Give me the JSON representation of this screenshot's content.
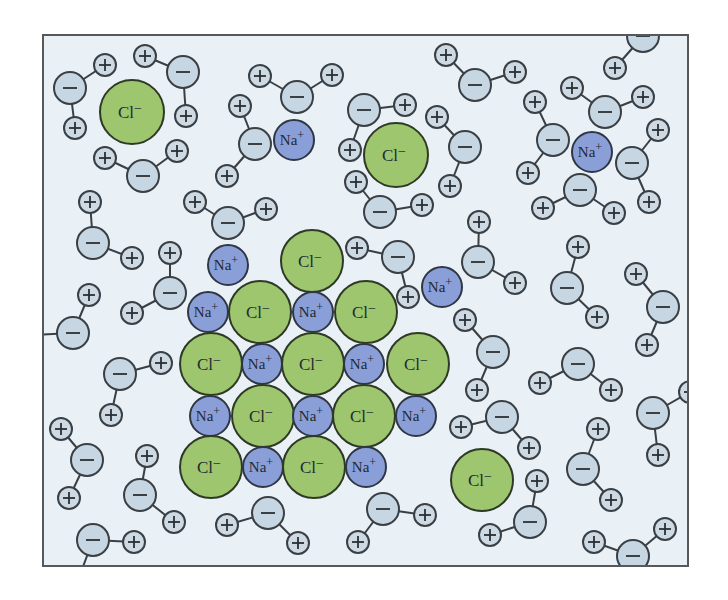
{
  "figure": {
    "title": "",
    "frame": {
      "x": 43,
      "y": 35,
      "width": 645,
      "height": 531
    },
    "colors": {
      "background": "#eaf1f6",
      "border": "#55595c",
      "chloride": "#9dc66e",
      "sodium": "#8a9fd8",
      "water_oxygen": "#c6d6e2",
      "water_hydrogen": "#cdd9e3",
      "outline": "#3a3f44"
    },
    "labels": {
      "sodium_symbol": "Na",
      "sodium_charge": "+",
      "chloride_symbol": "Cl",
      "chloride_charge": "−",
      "oxygen_sign": "−",
      "hydrogen_sign": "+"
    },
    "legend": {
      "sodium": "Na⁺ ion",
      "chloride": "Cl⁻ ion",
      "water": "H₂O molecule (− oxygen, + hydrogens)"
    }
  },
  "ions": [
    {
      "type": "Cl",
      "x": 132,
      "y": 112,
      "r": 32
    },
    {
      "type": "Na",
      "x": 294,
      "y": 140,
      "r": 20
    },
    {
      "type": "Cl",
      "x": 396,
      "y": 155,
      "r": 32
    },
    {
      "type": "Na",
      "x": 592,
      "y": 152,
      "r": 20
    },
    {
      "type": "Na",
      "x": 228,
      "y": 265,
      "r": 20
    },
    {
      "type": "Cl",
      "x": 312,
      "y": 261,
      "r": 31
    },
    {
      "type": "Na",
      "x": 442,
      "y": 287,
      "r": 20
    },
    {
      "type": "Cl",
      "x": 482,
      "y": 480,
      "r": 31
    },
    {
      "type": "Na",
      "x": 208,
      "y": 312,
      "r": 20
    },
    {
      "type": "Cl",
      "x": 260,
      "y": 312,
      "r": 31
    },
    {
      "type": "Na",
      "x": 313,
      "y": 312,
      "r": 20
    },
    {
      "type": "Cl",
      "x": 366,
      "y": 312,
      "r": 31
    },
    {
      "type": "Cl",
      "x": 211,
      "y": 364,
      "r": 31
    },
    {
      "type": "Na",
      "x": 262,
      "y": 364,
      "r": 20
    },
    {
      "type": "Cl",
      "x": 313,
      "y": 364,
      "r": 31
    },
    {
      "type": "Na",
      "x": 364,
      "y": 364,
      "r": 20
    },
    {
      "type": "Cl",
      "x": 418,
      "y": 364,
      "r": 31
    },
    {
      "type": "Na",
      "x": 210,
      "y": 416,
      "r": 20
    },
    {
      "type": "Cl",
      "x": 263,
      "y": 416,
      "r": 31
    },
    {
      "type": "Na",
      "x": 313,
      "y": 416,
      "r": 20
    },
    {
      "type": "Cl",
      "x": 364,
      "y": 416,
      "r": 31
    },
    {
      "type": "Na",
      "x": 416,
      "y": 416,
      "r": 20
    },
    {
      "type": "Cl",
      "x": 211,
      "y": 467,
      "r": 31
    },
    {
      "type": "Na",
      "x": 263,
      "y": 467,
      "r": 20
    },
    {
      "type": "Cl",
      "x": 314,
      "y": 467,
      "r": 31
    },
    {
      "type": "Na",
      "x": 366,
      "y": 467,
      "r": 20
    }
  ],
  "waters": [
    {
      "o": [
        70,
        88
      ],
      "h": [
        [
          105,
          65
        ],
        [
          75,
          128
        ]
      ]
    },
    {
      "o": [
        183,
        72
      ],
      "h": [
        [
          145,
          56
        ],
        [
          186,
          116
        ]
      ]
    },
    {
      "o": [
        143,
        176
      ],
      "h": [
        [
          105,
          158
        ],
        [
          177,
          151
        ]
      ]
    },
    {
      "o": [
        297,
        97
      ],
      "h": [
        [
          260,
          76
        ],
        [
          332,
          75
        ]
      ]
    },
    {
      "o": [
        255,
        144
      ],
      "h": [
        [
          240,
          106
        ],
        [
          227,
          176
        ]
      ]
    },
    {
      "o": [
        364,
        110
      ],
      "h": [
        [
          405,
          105
        ],
        [
          350,
          150
        ]
      ]
    },
    {
      "o": [
        465,
        147
      ],
      "h": [
        [
          437,
          117
        ],
        [
          450,
          186
        ]
      ]
    },
    {
      "o": [
        380,
        212
      ],
      "h": [
        [
          356,
          182
        ],
        [
          422,
          205
        ]
      ]
    },
    {
      "o": [
        475,
        85
      ],
      "h": [
        [
          446,
          55
        ],
        [
          515,
          72
        ]
      ]
    },
    {
      "o": [
        643,
        36
      ],
      "h": [
        [
          615,
          68
        ]
      ]
    },
    {
      "o": [
        605,
        112
      ],
      "h": [
        [
          572,
          88
        ],
        [
          643,
          97
        ]
      ]
    },
    {
      "o": [
        553,
        140
      ],
      "h": [
        [
          535,
          102
        ],
        [
          528,
          173
        ]
      ]
    },
    {
      "o": [
        632,
        163
      ],
      "h": [
        [
          658,
          130
        ],
        [
          649,
          202
        ]
      ]
    },
    {
      "o": [
        580,
        190
      ],
      "h": [
        [
          543,
          208
        ],
        [
          614,
          213
        ]
      ]
    },
    {
      "o": [
        93,
        243
      ],
      "h": [
        [
          90,
          202
        ],
        [
          132,
          258
        ]
      ]
    },
    {
      "o": [
        228,
        223
      ],
      "h": [
        [
          195,
          202
        ],
        [
          266,
          209
        ]
      ]
    },
    {
      "o": [
        170,
        293
      ],
      "h": [
        [
          170,
          253
        ],
        [
          132,
          313
        ]
      ]
    },
    {
      "o": [
        73,
        333
      ],
      "h": [
        [
          89,
          295
        ],
        [
          30,
          335
        ]
      ]
    },
    {
      "o": [
        120,
        374
      ],
      "h": [
        [
          161,
          363
        ],
        [
          111,
          415
        ]
      ]
    },
    {
      "o": [
        87,
        460
      ],
      "h": [
        [
          61,
          429
        ],
        [
          69,
          498
        ]
      ]
    },
    {
      "o": [
        140,
        495
      ],
      "h": [
        [
          147,
          456
        ],
        [
          174,
          522
        ]
      ]
    },
    {
      "o": [
        93,
        540
      ],
      "h": [
        [
          134,
          542
        ],
        [
          78,
          580
        ]
      ]
    },
    {
      "o": [
        268,
        513
      ],
      "h": [
        [
          227,
          525
        ],
        [
          298,
          543
        ]
      ]
    },
    {
      "o": [
        383,
        509
      ],
      "h": [
        [
          358,
          542
        ],
        [
          425,
          515
        ]
      ]
    },
    {
      "o": [
        398,
        257
      ],
      "h": [
        [
          357,
          248
        ],
        [
          408,
          297
        ]
      ]
    },
    {
      "o": [
        478,
        262
      ],
      "h": [
        [
          479,
          222
        ],
        [
          515,
          283
        ]
      ]
    },
    {
      "o": [
        493,
        352
      ],
      "h": [
        [
          465,
          320
        ],
        [
          477,
          390
        ]
      ]
    },
    {
      "o": [
        567,
        288
      ],
      "h": [
        [
          578,
          247
        ],
        [
          597,
          317
        ]
      ]
    },
    {
      "o": [
        663,
        307
      ],
      "h": [
        [
          636,
          274
        ],
        [
          647,
          345
        ]
      ]
    },
    {
      "o": [
        578,
        364
      ],
      "h": [
        [
          540,
          383
        ],
        [
          611,
          390
        ]
      ]
    },
    {
      "o": [
        502,
        417
      ],
      "h": [
        [
          461,
          427
        ],
        [
          529,
          448
        ]
      ]
    },
    {
      "o": [
        653,
        413
      ],
      "h": [
        [
          658,
          455
        ],
        [
          690,
          392
        ]
      ]
    },
    {
      "o": [
        583,
        469
      ],
      "h": [
        [
          598,
          429
        ],
        [
          611,
          500
        ]
      ]
    },
    {
      "o": [
        530,
        522
      ],
      "h": [
        [
          537,
          481
        ],
        [
          490,
          535
        ]
      ]
    },
    {
      "o": [
        633,
        556
      ],
      "h": [
        [
          594,
          542
        ],
        [
          665,
          529
        ]
      ]
    }
  ]
}
